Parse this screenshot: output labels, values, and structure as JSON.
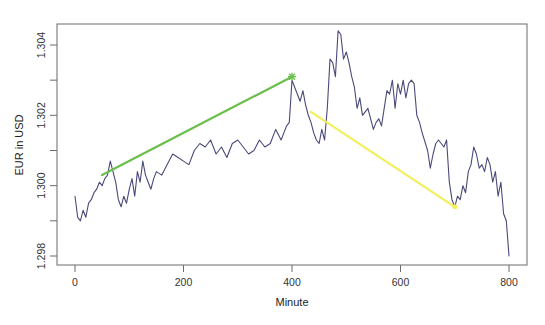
{
  "chart_data": {
    "type": "line",
    "title": "",
    "xlabel": "Minute",
    "ylabel": "EUR in USD",
    "xlim": [
      -10,
      820
    ],
    "ylim": [
      1.2977,
      1.3046
    ],
    "x_ticks": [
      0,
      200,
      400,
      600,
      800
    ],
    "x_tick_labels": [
      "0",
      "200",
      "400",
      "600",
      "800"
    ],
    "y_ticks": [
      1.298,
      1.299,
      1.3,
      1.301,
      1.302,
      1.303,
      1.304
    ],
    "y_tick_labels": [
      "1.298",
      "",
      "1.300",
      "",
      "1.302",
      "",
      "1.304"
    ],
    "grid": false,
    "legend": null,
    "series": [
      {
        "name": "EUR/USD",
        "color": "#4a4a7a",
        "x": [
          0,
          5,
          10,
          15,
          20,
          25,
          30,
          35,
          40,
          45,
          50,
          55,
          60,
          65,
          70,
          75,
          80,
          85,
          90,
          95,
          100,
          105,
          110,
          115,
          120,
          125,
          130,
          135,
          140,
          145,
          150,
          160,
          170,
          180,
          190,
          200,
          210,
          220,
          230,
          240,
          250,
          260,
          270,
          280,
          290,
          300,
          310,
          320,
          330,
          340,
          350,
          360,
          370,
          380,
          390,
          395,
          400,
          405,
          410,
          415,
          420,
          425,
          430,
          435,
          440,
          445,
          450,
          455,
          460,
          465,
          470,
          475,
          480,
          485,
          490,
          495,
          500,
          505,
          510,
          515,
          520,
          525,
          530,
          540,
          550,
          555,
          560,
          565,
          570,
          575,
          580,
          585,
          590,
          595,
          600,
          605,
          610,
          615,
          620,
          625,
          630,
          635,
          640,
          650,
          655,
          660,
          665,
          670,
          680,
          685,
          690,
          695,
          700,
          705,
          710,
          715,
          720,
          725,
          730,
          735,
          740,
          745,
          750,
          755,
          760,
          765,
          770,
          775,
          780,
          785,
          790,
          795,
          800
        ],
        "values": [
          1.2997,
          1.2991,
          1.299,
          1.2993,
          1.2991,
          1.2995,
          1.2996,
          1.2998,
          1.2999,
          1.3001,
          1.3,
          1.3002,
          1.3003,
          1.3007,
          1.3004,
          1.3001,
          1.2996,
          1.2994,
          1.2997,
          1.2995,
          1.2999,
          1.3002,
          1.2997,
          1.3004,
          1.3001,
          1.3007,
          1.3003,
          1.3001,
          1.2999,
          1.3002,
          1.3004,
          1.3003,
          1.3006,
          1.3009,
          1.3008,
          1.3007,
          1.3006,
          1.301,
          1.3012,
          1.3011,
          1.3013,
          1.3009,
          1.3011,
          1.3008,
          1.3012,
          1.3013,
          1.3011,
          1.3009,
          1.301,
          1.3013,
          1.3011,
          1.3012,
          1.3016,
          1.3013,
          1.3017,
          1.3018,
          1.303,
          1.3028,
          1.3026,
          1.3024,
          1.3027,
          1.3023,
          1.302,
          1.3018,
          1.3015,
          1.3013,
          1.3012,
          1.3016,
          1.3013,
          1.3022,
          1.3036,
          1.3035,
          1.3031,
          1.3044,
          1.3043,
          1.3036,
          1.3038,
          1.3035,
          1.3031,
          1.3028,
          1.3022,
          1.3025,
          1.302,
          1.3022,
          1.3016,
          1.3018,
          1.3019,
          1.3017,
          1.3022,
          1.3027,
          1.3026,
          1.303,
          1.3022,
          1.3029,
          1.3026,
          1.303,
          1.3025,
          1.3029,
          1.303,
          1.3029,
          1.302,
          1.3018,
          1.3015,
          1.301,
          1.3005,
          1.3009,
          1.3012,
          1.3013,
          1.3011,
          1.3013,
          1.3001,
          1.2996,
          1.2994,
          1.2997,
          1.2996,
          1.3,
          1.2998,
          1.3004,
          1.3006,
          1.3011,
          1.3009,
          1.3005,
          1.3006,
          1.3004,
          1.3008,
          1.3006,
          1.3001,
          1.3004,
          1.2997,
          1.3001,
          1.2992,
          1.299,
          1.298
        ]
      },
      {
        "name": "uptrend",
        "color": "#6abf4b",
        "x": [
          50,
          400
        ],
        "values": [
          1.3003,
          1.3031
        ],
        "marker_end": "asterisk"
      },
      {
        "name": "downtrend",
        "color": "#f2ef5a",
        "x": [
          435,
          700
        ],
        "values": [
          1.3021,
          1.2994
        ]
      }
    ]
  },
  "axes": {
    "xlabel": "Minute",
    "ylabel": "EUR in USD"
  }
}
